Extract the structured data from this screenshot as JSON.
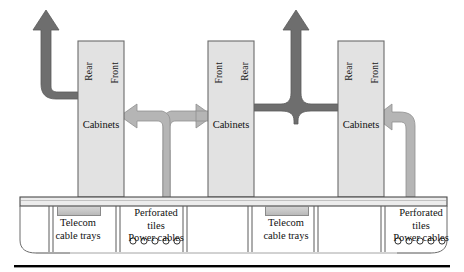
{
  "diagram": {
    "colors": {
      "hot_air_arrow": "#6e6e6e",
      "cold_air_arrow": "#b3b3b3",
      "cabinet_fill": "#e2e2e2",
      "cabinet_stroke": "#6b6b6b",
      "floor_fill": "#ececec",
      "floor_stroke": "#4a4a4a",
      "tray_swatch": "#c6c6c6",
      "text": "#111111",
      "rule": "#000000"
    },
    "cabinets": [
      {
        "id": "cabinet-1",
        "left_label": "Rear",
        "right_label": "Front",
        "caption": "Cabinets"
      },
      {
        "id": "cabinet-2",
        "left_label": "Front",
        "right_label": "Rear",
        "caption": "Cabinets"
      },
      {
        "id": "cabinet-3",
        "left_label": "Rear",
        "right_label": "Front",
        "caption": "Cabinets"
      }
    ],
    "underfloor_legend": [
      {
        "id": "telecom-left",
        "lines": [
          "Telecom",
          "cable trays"
        ],
        "has_swatch": true,
        "has_cable_circles": false
      },
      {
        "id": "perforated-left",
        "lines": [
          "Perforated",
          "tiles",
          "Power cables"
        ],
        "has_swatch": false,
        "has_cable_circles": true,
        "cable_count": 5
      },
      {
        "id": "telecom-right",
        "lines": [
          "Telecom",
          "cable trays"
        ],
        "has_swatch": true,
        "has_cable_circles": false
      },
      {
        "id": "perforated-right",
        "lines": [
          "Perforated",
          "tiles",
          "Power cables"
        ],
        "has_swatch": false,
        "has_cable_circles": true,
        "cable_count": 5
      }
    ],
    "airflow": {
      "hot_exhaust_up_count": 2,
      "cold_supply_risers": 3,
      "description": "Hot air rises from cabinet rears; cold air rises through perforated tiles into cabinet fronts"
    }
  }
}
